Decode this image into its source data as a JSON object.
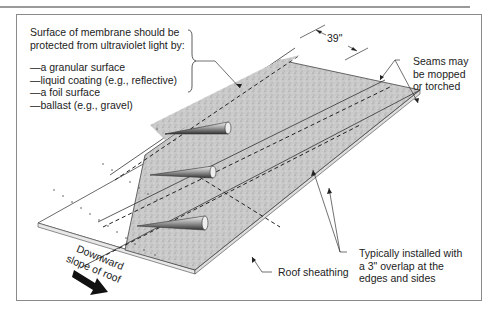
{
  "figure": {
    "uv_note": {
      "lines": [
        "Surface of membrane should be",
        "protected from ultraviolet light by:"
      ],
      "items": [
        "—a granular surface",
        "—liquid coating (e.g., reflective)",
        "—a foil surface",
        "—ballast (e.g., gravel)"
      ]
    },
    "dimension_label": "39\"",
    "seams_label": [
      "Seams may",
      "be mopped",
      "or torched"
    ],
    "overlap_label": [
      "Typically installed with",
      "a 3\" overlap at the",
      "edges and sides"
    ],
    "sheathing_label": "Roof sheathing",
    "slope_label": [
      "Downward",
      "slope of roof"
    ],
    "icons": {
      "slope_arrow": "thick-right-arrow",
      "rolls": "membrane-roll-cones"
    },
    "colors": {
      "membrane": "#c8c8c8",
      "sheathing": "#ffffff",
      "lines": "#333333",
      "frame": "#8a8a8a"
    }
  }
}
